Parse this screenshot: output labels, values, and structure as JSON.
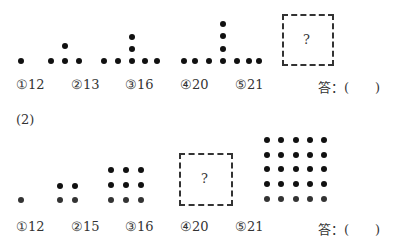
{
  "problem1": {
    "figures": [
      {
        "index": 1,
        "dots": [
          [
            21,
            61
          ]
        ]
      },
      {
        "index": 2,
        "dots": [
          [
            51,
            61
          ],
          [
            65,
            61
          ],
          [
            79,
            61
          ],
          [
            65,
            46
          ]
        ]
      },
      {
        "index": 3,
        "dots": [
          [
            104,
            61
          ],
          [
            118,
            61
          ],
          [
            132,
            61
          ],
          [
            145,
            61
          ],
          [
            157,
            61
          ],
          [
            132,
            49
          ],
          [
            132,
            37
          ]
        ]
      },
      {
        "index": 4,
        "dots": [
          [
            184,
            61
          ],
          [
            195,
            61
          ],
          [
            209,
            61
          ],
          [
            223,
            61
          ],
          [
            237,
            61
          ],
          [
            249,
            61
          ],
          [
            259,
            61
          ],
          [
            223,
            49
          ],
          [
            223,
            36
          ],
          [
            223,
            24
          ]
        ]
      }
    ],
    "unknown_box": {
      "x": 282,
      "y": 14,
      "w": 52,
      "h": 52,
      "symbol": "?"
    },
    "options": [
      {
        "mark": "①",
        "value": "12"
      },
      {
        "mark": "②",
        "value": "13"
      },
      {
        "mark": "③",
        "value": "16"
      },
      {
        "mark": "④",
        "value": "20"
      },
      {
        "mark": "⑤",
        "value": "21"
      }
    ],
    "answer_label": "答：(　　)"
  },
  "problem2": {
    "label": "(2)",
    "figures": [
      {
        "index": 1,
        "cols": [
          21
        ],
        "rows": [
          200
        ]
      },
      {
        "index": 2,
        "cols": [
          60,
          75
        ],
        "rows": [
          186,
          200
        ]
      },
      {
        "index": 3,
        "cols": [
          111,
          126,
          141
        ],
        "rows": [
          170,
          185,
          200
        ]
      },
      {
        "index": 5,
        "cols": [
          267,
          281,
          296,
          310,
          324
        ],
        "rows": [
          140,
          155,
          169,
          184,
          199
        ]
      }
    ],
    "unknown_box": {
      "x": 179,
      "y": 153,
      "w": 54,
      "h": 53,
      "symbol": "?"
    },
    "options": [
      {
        "mark": "①",
        "value": "12"
      },
      {
        "mark": "②",
        "value": "15"
      },
      {
        "mark": "③",
        "value": "16"
      },
      {
        "mark": "④",
        "value": "20"
      },
      {
        "mark": "⑤",
        "value": "21"
      }
    ],
    "answer_label": "答：(　　)"
  }
}
